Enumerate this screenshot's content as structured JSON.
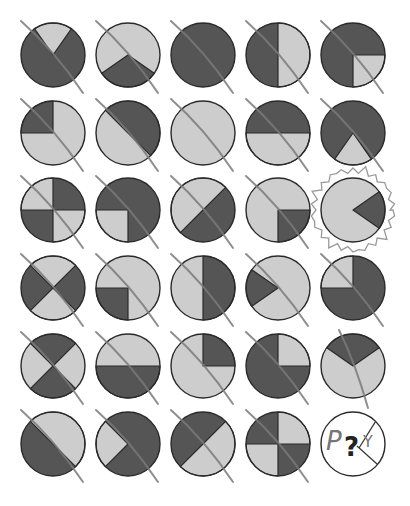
{
  "puzzle": {
    "colors": {
      "dark": "#555555",
      "light": "#cdcdcd",
      "stroke": "#2a2a2a",
      "slash": "#7a7a7a",
      "highlight": "#9a9a9a",
      "background": "#ffffff"
    },
    "grid": {
      "columns": 5,
      "rows": 6,
      "col_x": [
        53,
        128,
        203,
        278,
        353
      ],
      "row_y": [
        55,
        133,
        210,
        288,
        366,
        444
      ],
      "radius": 32
    },
    "cells": [
      {
        "row": 1,
        "col": 1,
        "base": "dark",
        "wedges": [
          [
            -125,
            -55
          ]
        ],
        "slashed": true
      },
      {
        "row": 1,
        "col": 2,
        "base": "light",
        "wedges": [
          [
            35,
            145
          ]
        ],
        "slashed": true
      },
      {
        "row": 1,
        "col": 3,
        "base": "dark",
        "wedges": [],
        "slashed": true
      },
      {
        "row": 1,
        "col": 4,
        "base": "dark",
        "wedges": [
          [
            -90,
            90
          ]
        ],
        "slashed": true
      },
      {
        "row": 1,
        "col": 5,
        "base": "dark",
        "wedges": [
          [
            0,
            90
          ]
        ],
        "slashed": true
      },
      {
        "row": 2,
        "col": 1,
        "base": "light",
        "wedges": [
          [
            180,
            270
          ]
        ],
        "slashed": true
      },
      {
        "row": 2,
        "col": 2,
        "base": "light",
        "wedges": [
          [
            -135,
            45
          ]
        ],
        "slashed": true
      },
      {
        "row": 2,
        "col": 3,
        "base": "light",
        "wedges": [],
        "slashed": true
      },
      {
        "row": 2,
        "col": 4,
        "base": "dark",
        "wedges": [
          [
            0,
            180
          ]
        ],
        "slashed": true
      },
      {
        "row": 2,
        "col": 5,
        "base": "dark",
        "wedges": [
          [
            55,
            125
          ]
        ],
        "slashed": true
      },
      {
        "row": 3,
        "col": 1,
        "base": "dark",
        "wedges": [
          [
            180,
            270
          ],
          [
            0,
            90
          ]
        ],
        "slashed": true
      },
      {
        "row": 3,
        "col": 2,
        "base": "dark",
        "wedges": [
          [
            90,
            180
          ]
        ],
        "slashed": true
      },
      {
        "row": 3,
        "col": 3,
        "base": "dark",
        "wedges": [
          [
            135,
            315
          ]
        ],
        "slashed": true
      },
      {
        "row": 3,
        "col": 4,
        "base": "light",
        "wedges": [
          [
            0,
            90
          ]
        ],
        "slashed": true
      },
      {
        "row": 3,
        "col": 5,
        "base": "light",
        "wedges": [
          [
            -35,
            35
          ]
        ],
        "slashed": false,
        "highlighted": true
      },
      {
        "row": 4,
        "col": 1,
        "base": "dark",
        "wedges": [
          [
            -135,
            -45
          ],
          [
            45,
            135
          ]
        ],
        "slashed": true
      },
      {
        "row": 4,
        "col": 2,
        "base": "light",
        "wedges": [
          [
            90,
            180
          ]
        ],
        "slashed": true
      },
      {
        "row": 4,
        "col": 3,
        "base": "light",
        "wedges": [
          [
            -90,
            90
          ]
        ],
        "slashed": true
      },
      {
        "row": 4,
        "col": 4,
        "base": "light",
        "wedges": [
          [
            145,
            215
          ]
        ],
        "slashed": true
      },
      {
        "row": 4,
        "col": 5,
        "base": "dark",
        "wedges": [
          [
            180,
            270
          ]
        ],
        "slashed": true
      },
      {
        "row": 5,
        "col": 1,
        "base": "light",
        "wedges": [
          [
            -135,
            -45
          ],
          [
            45,
            135
          ]
        ],
        "slashed": true
      },
      {
        "row": 5,
        "col": 2,
        "base": "light",
        "wedges": [
          [
            0,
            180
          ]
        ],
        "slashed": true
      },
      {
        "row": 5,
        "col": 3,
        "base": "light",
        "wedges": [
          [
            -90,
            0
          ]
        ],
        "slashed": true
      },
      {
        "row": 5,
        "col": 4,
        "base": "dark",
        "wedges": [
          [
            -90,
            0
          ]
        ],
        "slashed": true
      },
      {
        "row": 5,
        "col": 5,
        "base": "light",
        "wedges": [
          [
            -145,
            -35
          ]
        ],
        "slashed": true,
        "steep": true
      },
      {
        "row": 6,
        "col": 1,
        "base": "dark",
        "wedges": [
          [
            -135,
            45
          ]
        ],
        "slashed": true
      },
      {
        "row": 6,
        "col": 2,
        "base": "dark",
        "wedges": [
          [
            135,
            225
          ]
        ],
        "slashed": true
      },
      {
        "row": 6,
        "col": 3,
        "base": "dark",
        "wedges": [
          [
            -45,
            135
          ]
        ],
        "slashed": true
      },
      {
        "row": 6,
        "col": 4,
        "base": "dark",
        "wedges": [
          [
            -90,
            0
          ],
          [
            90,
            180
          ]
        ],
        "slashed": true
      },
      {
        "row": 6,
        "col": 5,
        "base": "blank",
        "wedges": [],
        "slashed": false,
        "question": true
      }
    ],
    "answer_cell": {
      "symbol": "?",
      "left_letter": "P",
      "right_letter": "Y"
    }
  }
}
